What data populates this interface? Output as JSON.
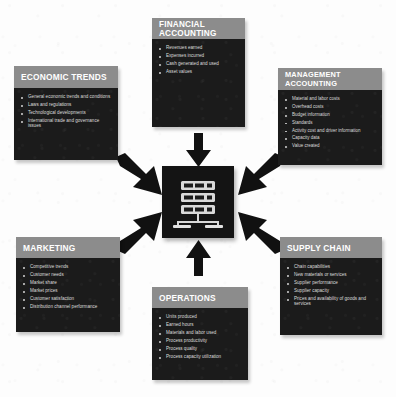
{
  "diagram": {
    "type": "hub-and-spoke",
    "background_color": "#fdfdfd",
    "header_color": "#8c8c8c",
    "body_color": "#1b1b1b",
    "text_color": "#e6e6e6",
    "arrow_color": "#111111"
  },
  "center": {
    "icon": "database-server-icon",
    "label": "",
    "units": 3
  },
  "nodes": [
    {
      "id": "financial-accounting",
      "title": "FINANCIAL ACCOUNTING",
      "position": "top",
      "bullets": [
        "Revenues earned",
        "Expenses incurred",
        "Cash generated and used",
        "Asset values"
      ]
    },
    {
      "id": "economic-trends",
      "title": "ECONOMIC TRENDS",
      "position": "top-left",
      "bullets": [
        "General economic trends and conditions",
        "Laws and regulations",
        "Technological developments",
        "International trade and governance issues"
      ]
    },
    {
      "id": "management-accounting",
      "title": "MANAGEMENT ACCOUNTING",
      "position": "top-right",
      "bullets": [
        "Material and labor costs",
        "Overhead costs",
        "Budget information",
        "Standards",
        "Activity cost and driver information",
        "Capacity data",
        "Value created"
      ]
    },
    {
      "id": "marketing",
      "title": "MARKETING",
      "position": "bottom-left",
      "bullets": [
        "Competitive trends",
        "Customer needs",
        "Market share",
        "Market prices",
        "Customer satisfaction",
        "Distribution channel performance"
      ]
    },
    {
      "id": "supply-chain",
      "title": "SUPPLY CHAIN",
      "position": "bottom-right",
      "bullets": [
        "Chain capabilities",
        "New materials or services",
        "Supplier performance",
        "Supplier capacity",
        "Prices and availability of goods and services"
      ]
    },
    {
      "id": "operations",
      "title": "OPERATIONS",
      "position": "bottom",
      "bullets": [
        "Units produced",
        "Earned hours",
        "Materials and labor used",
        "Process productivity",
        "Process quality",
        "Process capacity utilization"
      ]
    }
  ],
  "arrows": [
    {
      "id": "arrow-from-financial-accounting",
      "direction": "down"
    },
    {
      "id": "arrow-from-economic-trends",
      "direction": "down-right"
    },
    {
      "id": "arrow-from-management-accounting",
      "direction": "down-left"
    },
    {
      "id": "arrow-from-marketing",
      "direction": "up-right"
    },
    {
      "id": "arrow-from-supply-chain",
      "direction": "up-left"
    },
    {
      "id": "arrow-from-operations",
      "direction": "up"
    }
  ]
}
